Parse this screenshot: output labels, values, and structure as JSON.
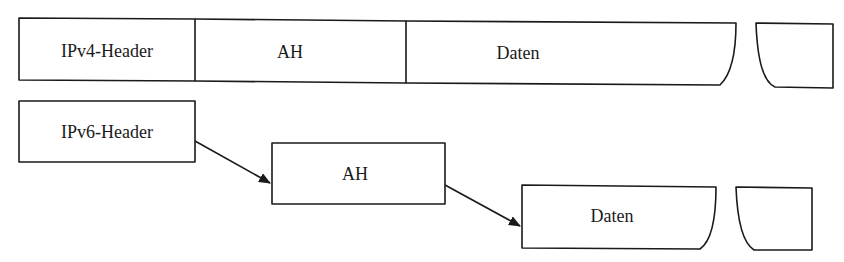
{
  "diagram": {
    "ipv4_row": {
      "segments": [
        {
          "label": "IPv4-Header"
        },
        {
          "label": "AH"
        },
        {
          "label": "Daten"
        }
      ]
    },
    "ipv6_row": {
      "nodes": [
        {
          "label": "IPv6-Header"
        },
        {
          "label": "AH"
        },
        {
          "label": "Daten"
        }
      ],
      "edges": [
        {
          "from": "IPv6-Header",
          "to": "AH"
        },
        {
          "from": "AH",
          "to": "Daten"
        }
      ]
    },
    "colors": {
      "line": "#1a1a1a",
      "background": "#ffffff"
    }
  }
}
